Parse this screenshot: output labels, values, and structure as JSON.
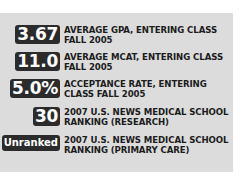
{
  "stats": [
    {
      "value": "3.67",
      "label_line1": "AVERAGE GPA, ENTERING CLASS",
      "label_line2": "FALL 2005"
    },
    {
      "value": "11.0",
      "label_line1": "AVERAGE MCAT, ENTERING CLASS",
      "label_line2": "FALL 2005"
    },
    {
      "value": "5.0%",
      "label_line1": "ACCEPTANCE RATE, ENTERING",
      "label_line2": "CLASS FALL 2005"
    },
    {
      "value": "30",
      "label_line1": "2007 U.S. NEWS MEDICAL SCHOOL",
      "label_line2": "RANKING (RESEARCH)"
    },
    {
      "value": "Unranked",
      "label_line1": "2007 U.S. NEWS MEDICAL SCHOOL",
      "label_line2": "RANKING (PRIMARY CARE)"
    }
  ],
  "colors": {
    "panel": "#dcdcdc",
    "badge": "#2b2b2b",
    "badge_text": "#ffffff",
    "label": "#1c1c1c"
  }
}
